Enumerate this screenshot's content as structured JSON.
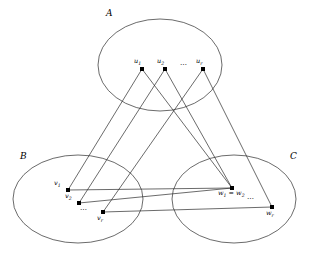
{
  "figure": {
    "background_color": "#ffffff",
    "stroke_color": "#2b2b2b",
    "node_color": "#000000"
  },
  "sets": [
    {
      "id": "A",
      "label": "A",
      "label_x": 106,
      "label_y": 9,
      "cx": 160,
      "cy": 65,
      "rx": 62,
      "ry": 46
    },
    {
      "id": "B",
      "label": "B",
      "label_x": 20,
      "label_y": 152,
      "cx": 78,
      "cy": 199,
      "rx": 65,
      "ry": 44
    },
    {
      "id": "C",
      "label": "C",
      "label_x": 290,
      "label_y": 152,
      "cx": 234,
      "cy": 199,
      "rx": 62,
      "ry": 44
    }
  ],
  "vertices": {
    "A": [
      {
        "id": "u1",
        "base": "u",
        "sub": "1",
        "x": 142,
        "y": 69,
        "label_x": 134,
        "label_y": 58
      },
      {
        "id": "u2",
        "base": "u",
        "sub": "2",
        "x": 165,
        "y": 69,
        "label_x": 157,
        "label_y": 58
      },
      {
        "id": "ur",
        "base": "u",
        "sub": "r",
        "x": 203,
        "y": 69,
        "label_x": 196,
        "label_y": 58
      }
    ],
    "B": [
      {
        "id": "v1",
        "base": "v",
        "sub": "1",
        "x": 68,
        "y": 190,
        "label_x": 54,
        "label_y": 180
      },
      {
        "id": "v2",
        "base": "v",
        "sub": "2",
        "x": 79,
        "y": 203,
        "label_x": 65,
        "label_y": 193
      },
      {
        "id": "vr",
        "base": "v",
        "sub": "r",
        "x": 103,
        "y": 212,
        "label_x": 97,
        "label_y": 215
      }
    ],
    "C": [
      {
        "id": "w12",
        "base": "w",
        "sub": "1",
        "x": 232,
        "y": 188,
        "label_x": 218,
        "label_y": 190
      },
      {
        "id": "wr",
        "base": "w",
        "sub": "r",
        "x": 272,
        "y": 207,
        "label_x": 266,
        "label_y": 210
      }
    ]
  },
  "equation_labels": [
    {
      "id": "w1-eq-w2",
      "text_left": "w",
      "sub_left": "1",
      "operator": "=",
      "text_right": "w",
      "sub_right": "2",
      "x": 218,
      "y": 190
    }
  ],
  "ellipsis_marks": [
    {
      "id": "ellipsis-A",
      "text": "⋯",
      "x": 180,
      "y": 62
    },
    {
      "id": "ellipsis-B",
      "text": "⋯",
      "x": 80,
      "y": 207
    },
    {
      "id": "ellipsis-C",
      "text": "⋯",
      "x": 247,
      "y": 196
    }
  ],
  "edges": [
    {
      "id": "edge-u1-v1",
      "from": "u1",
      "to": "v1",
      "x1": 142,
      "y1": 69,
      "x2": 68,
      "y2": 190
    },
    {
      "id": "edge-u1-w12",
      "from": "u1",
      "to": "w12",
      "x1": 142,
      "y1": 69,
      "x2": 232,
      "y2": 188
    },
    {
      "id": "edge-u2-v2",
      "from": "u2",
      "to": "v2",
      "x1": 165,
      "y1": 69,
      "x2": 79,
      "y2": 203
    },
    {
      "id": "edge-u2-w12",
      "from": "u2",
      "to": "w12",
      "x1": 165,
      "y1": 69,
      "x2": 232,
      "y2": 188
    },
    {
      "id": "edge-ur-vr",
      "from": "ur",
      "to": "vr",
      "x1": 203,
      "y1": 69,
      "x2": 103,
      "y2": 212
    },
    {
      "id": "edge-ur-wr",
      "from": "ur",
      "to": "wr",
      "x1": 203,
      "y1": 69,
      "x2": 272,
      "y2": 207
    },
    {
      "id": "edge-v1-w12",
      "from": "v1",
      "to": "w12",
      "x1": 68,
      "y1": 190,
      "x2": 232,
      "y2": 188
    },
    {
      "id": "edge-v2-w12",
      "from": "v2",
      "to": "w12",
      "x1": 79,
      "y1": 203,
      "x2": 232,
      "y2": 188
    },
    {
      "id": "edge-vr-wr",
      "from": "vr",
      "to": "wr",
      "x1": 103,
      "y1": 212,
      "x2": 272,
      "y2": 207
    }
  ]
}
